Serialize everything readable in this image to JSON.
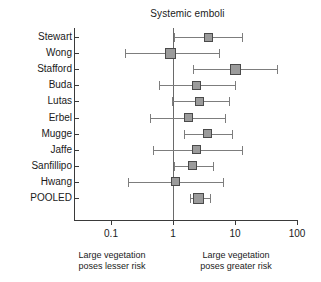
{
  "chart_data": {
    "type": "forest",
    "title": "Systemic emboli",
    "xlabel": "",
    "ylabel": "",
    "xscale": "log",
    "xlim": [
      0.03,
      130
    ],
    "xticks": [
      0.1,
      1,
      10,
      100
    ],
    "xticklabels": [
      "0.1",
      "1",
      "10",
      "100"
    ],
    "reference_line": 1,
    "grid": false,
    "legend": null,
    "effect_measure": "odds ratio",
    "categories": [
      "Stewart",
      "Wong",
      "Stafford",
      "Buda",
      "Lutas",
      "Erbel",
      "Mugge",
      "Jaffe",
      "Sanfillipo",
      "Hwang",
      "POOLED"
    ],
    "rows": [
      {
        "label": "Stewart",
        "estimate": 3.8,
        "ci_low": 1.05,
        "ci_high": 13.0,
        "pooled": false
      },
      {
        "label": "Wong",
        "estimate": 0.92,
        "ci_low": 0.17,
        "ci_high": 5.5,
        "pooled": false
      },
      {
        "label": "Stafford",
        "estimate": 10.0,
        "ci_low": 2.1,
        "ci_high": 48.0,
        "pooled": false
      },
      {
        "label": "Buda",
        "estimate": 2.4,
        "ci_low": 0.6,
        "ci_high": 10.0,
        "pooled": false
      },
      {
        "label": "Lutas",
        "estimate": 2.7,
        "ci_low": 0.95,
        "ci_high": 8.0,
        "pooled": false
      },
      {
        "label": "Erbel",
        "estimate": 1.8,
        "ci_low": 0.42,
        "ci_high": 7.0,
        "pooled": false
      },
      {
        "label": "Mugge",
        "estimate": 3.6,
        "ci_low": 1.5,
        "ci_high": 9.0,
        "pooled": false
      },
      {
        "label": "Jaffe",
        "estimate": 2.4,
        "ci_low": 0.48,
        "ci_high": 13.0,
        "pooled": false
      },
      {
        "label": "Sanfillipo",
        "estimate": 2.1,
        "ci_low": 1.05,
        "ci_high": 4.5,
        "pooled": false
      },
      {
        "label": "Hwang",
        "estimate": 1.1,
        "ci_low": 0.19,
        "ci_high": 6.5,
        "pooled": false
      },
      {
        "label": "POOLED",
        "estimate": 2.6,
        "ci_low": 1.85,
        "ci_high": 4.0,
        "pooled": true
      }
    ],
    "annotations": {
      "left_caption_line1": "Large vegetation",
      "left_caption_line2": "poses lesser risk",
      "right_caption_line1": "Large vegetation",
      "right_caption_line2": "poses greater risk"
    },
    "colors": {
      "marker_fill": "#9b9b9b",
      "marker_edge": "#4a4a4a",
      "whisker": "#7d7d7d",
      "axis": "#3a3a3a",
      "reference": "#6a6a6a",
      "background": "#ffffff",
      "text": "#1a1a1a"
    }
  }
}
